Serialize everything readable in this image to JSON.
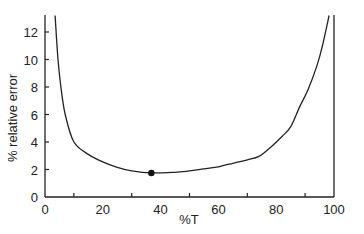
{
  "chart_data": {
    "type": "line",
    "title": "",
    "xlabel": "%T",
    "ylabel": "% relative error",
    "xlim": [
      0,
      100
    ],
    "ylim": [
      0,
      13.2
    ],
    "grid": false,
    "legend": null,
    "x_ticks": [
      0,
      20,
      40,
      60,
      80,
      100
    ],
    "x_minor_ticks": [
      10,
      30,
      50,
      70,
      90
    ],
    "y_ticks": [
      0,
      2,
      4,
      6,
      8,
      10,
      12
    ],
    "series": [
      {
        "name": "relative error",
        "x": [
          3.5,
          4.5,
          5.5,
          7,
          10,
          15,
          20,
          25,
          30,
          36.8,
          45,
          50,
          55,
          60,
          65,
          70,
          74,
          78,
          82,
          85,
          88,
          91,
          94,
          96,
          98.3
        ],
        "y": [
          13.2,
          10,
          8,
          6,
          4.0,
          3.1,
          2.55,
          2.15,
          1.9,
          1.75,
          1.8,
          1.9,
          2.05,
          2.2,
          2.45,
          2.7,
          2.95,
          3.6,
          4.4,
          5.1,
          6.5,
          7.8,
          9.5,
          11,
          13.2
        ]
      }
    ],
    "annotations": [
      {
        "type": "point",
        "x": 36.8,
        "y": 1.75,
        "label": "minimum"
      }
    ]
  }
}
